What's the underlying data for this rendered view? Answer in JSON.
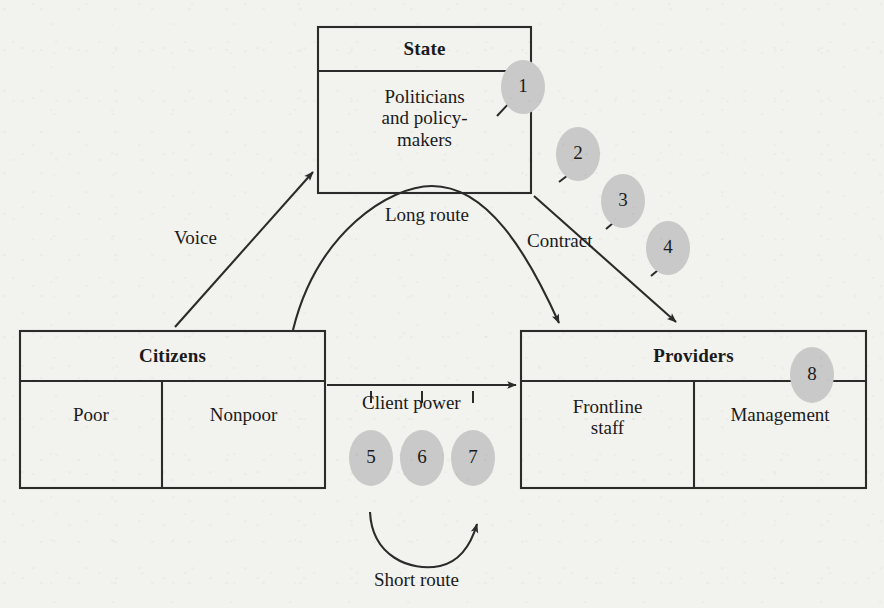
{
  "diagram": {
    "background_color": "#f2f2ef",
    "line_color": "#2b2b2b",
    "badge_fill": "#c9c9c9",
    "boxes": [
      {
        "id": "state",
        "title": "State",
        "cells": [
          "Politicians\nand policy-\nmakers"
        ]
      },
      {
        "id": "citizens",
        "title": "Citizens",
        "cells": [
          "Poor",
          "Nonpoor"
        ]
      },
      {
        "id": "providers",
        "title": "Providers",
        "cells": [
          "Frontline\nstaff",
          "Management"
        ]
      }
    ],
    "routes": [
      {
        "id": "voice",
        "label": "Voice"
      },
      {
        "id": "long-route",
        "label": "Long route"
      },
      {
        "id": "contract",
        "label": "Contract"
      },
      {
        "id": "client-power",
        "label": "Client power"
      },
      {
        "id": "short-route",
        "label": "Short route"
      }
    ],
    "badges": [
      {
        "id": "badge-1",
        "label": "1",
        "attached_to": "state"
      },
      {
        "id": "badge-2",
        "label": "2",
        "attached_to": "contract"
      },
      {
        "id": "badge-3",
        "label": "3",
        "attached_to": "contract"
      },
      {
        "id": "badge-4",
        "label": "4",
        "attached_to": "contract"
      },
      {
        "id": "badge-5",
        "label": "5",
        "attached_to": "client-power"
      },
      {
        "id": "badge-6",
        "label": "6",
        "attached_to": "client-power"
      },
      {
        "id": "badge-7",
        "label": "7",
        "attached_to": "client-power"
      },
      {
        "id": "badge-8",
        "label": "8",
        "attached_to": "providers"
      }
    ]
  }
}
